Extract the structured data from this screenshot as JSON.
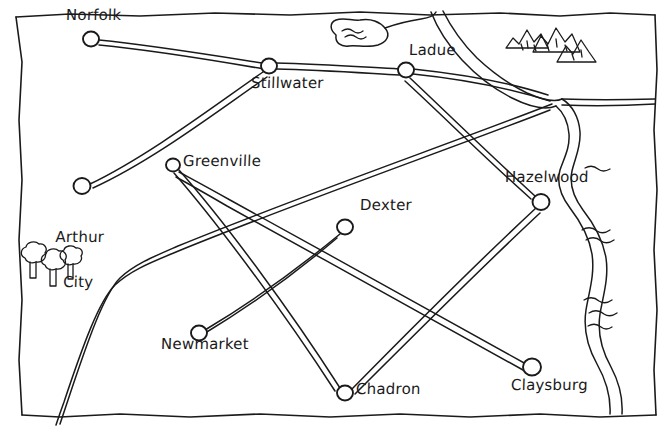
{
  "map": {
    "title": "Hand-drawn road map",
    "style": "sketch",
    "ink_color": "#1a1a1a",
    "paper_color": "#ffffff",
    "width": 670,
    "height": 430,
    "cities": [
      {
        "name": "Norfolk",
        "x": 91,
        "y": 38,
        "label_x": 67,
        "label_y": 9,
        "lines": [
          "Norfolk"
        ]
      },
      {
        "name": "Stillwater",
        "x": 269,
        "y": 66,
        "label_x": 251,
        "label_y": 76,
        "lines": [
          "Stillwater"
        ]
      },
      {
        "name": "Ladue",
        "x": 406,
        "y": 70,
        "label_x": 410,
        "label_y": 44,
        "lines": [
          "Ladue"
        ]
      },
      {
        "name": "Arthur City",
        "x": 82,
        "y": 186,
        "label_x": 42,
        "label_y": 200,
        "lines": [
          "Arthur",
          "City"
        ]
      },
      {
        "name": "Greenville",
        "x": 173,
        "y": 165,
        "label_x": 184,
        "label_y": 154,
        "lines": [
          "Greenville"
        ]
      },
      {
        "name": "Dexter",
        "x": 345,
        "y": 227,
        "label_x": 361,
        "label_y": 198,
        "lines": [
          "Dexter"
        ]
      },
      {
        "name": "Hazelwood",
        "x": 541,
        "y": 202,
        "label_x": 506,
        "label_y": 170,
        "lines": [
          "Hazelwood"
        ]
      },
      {
        "name": "Newmarket",
        "x": 199,
        "y": 333,
        "label_x": 162,
        "label_y": 337,
        "lines": [
          "Newmarket"
        ]
      },
      {
        "name": "Chadron",
        "x": 345,
        "y": 393,
        "label_x": 357,
        "label_y": 382,
        "lines": [
          "Chadron"
        ]
      },
      {
        "name": "Claysburg",
        "x": 532,
        "y": 367,
        "label_x": 512,
        "label_y": 378,
        "lines": [
          "Claysburg"
        ]
      }
    ],
    "roads": [
      {
        "from": "Norfolk",
        "to": "Stillwater"
      },
      {
        "from": "Stillwater",
        "to": "Ladue"
      },
      {
        "from": "Stillwater",
        "to": "Arthur City"
      },
      {
        "from": "Ladue",
        "to": "Hazelwood"
      },
      {
        "from": "Ladue",
        "to": "off-map-southwest"
      },
      {
        "from": "Greenville",
        "to": "Chadron"
      },
      {
        "from": "Newmarket",
        "to": "Dexter"
      },
      {
        "from": "Hazelwood",
        "to": "Chadron"
      },
      {
        "from": "Claysburg",
        "to": "Greenville"
      }
    ],
    "features": [
      {
        "kind": "river",
        "name": "river",
        "position": "right-edge"
      },
      {
        "kind": "lake",
        "name": "lake",
        "position": "top-center"
      },
      {
        "kind": "mountains",
        "name": "mountain-range",
        "position": "top-right",
        "count": 5
      },
      {
        "kind": "forest",
        "name": "tree-cluster",
        "position": "left",
        "count": 3
      }
    ],
    "border": {
      "name": "map-border",
      "style": "wobbly-rectangle"
    }
  }
}
